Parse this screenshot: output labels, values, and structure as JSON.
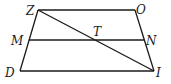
{
  "figure": {
    "type": "trapezoid",
    "points": {
      "Z": {
        "label": "Z",
        "x": 38,
        "y": 10
      },
      "O": {
        "label": "O",
        "x": 135,
        "y": 10
      },
      "I": {
        "label": "I",
        "x": 154,
        "y": 71
      },
      "D": {
        "label": "D",
        "x": 20,
        "y": 71
      },
      "M": {
        "label": "M",
        "x": 29,
        "y": 40
      },
      "N": {
        "label": "N",
        "x": 144,
        "y": 40
      },
      "T": {
        "label": "T",
        "x": 96,
        "y": 40
      }
    },
    "segments": [
      "ZO",
      "OI",
      "ID",
      "DZ",
      "MN",
      "ZI"
    ],
    "line_color": "#1a1a1a"
  }
}
